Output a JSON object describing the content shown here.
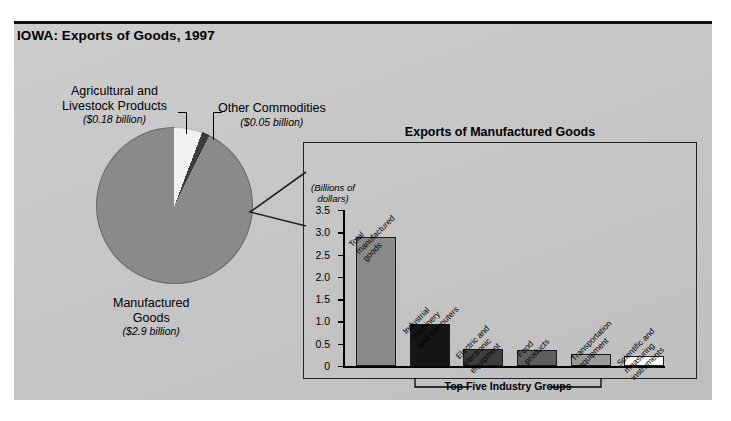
{
  "figure": {
    "title": "IOWA: Exports of Goods, 1997",
    "background_color": "#c9c9c9"
  },
  "pie": {
    "slices": [
      {
        "label": "Agricultural and Livestock Products",
        "label_line1": "Agricultural and",
        "label_line2": "Livestock Products",
        "value_text": "($0.18 billion)",
        "value": 0.18,
        "color": "#f2f2f2"
      },
      {
        "label": "Other Commodities",
        "label_line1": "Other Commodities",
        "label_line2": "",
        "value_text": "($0.05 billion)",
        "value": 0.05,
        "color": "#3b3b3b"
      },
      {
        "label": "Manufactured Goods",
        "label_line1": "Manufactured",
        "label_line2": "Goods",
        "value_text": "($2.9 billion)",
        "value": 2.9,
        "color": "#8a8a8a"
      }
    ]
  },
  "callout": {
    "title": "Exports of Manufactured Goods",
    "axis_units_line1": "(Billions of",
    "axis_units_line2": "dollars)",
    "bracket_label": "Top Five Industry Groups"
  },
  "chart_data": {
    "type": "bar",
    "title": "Exports of Manufactured Goods",
    "xlabel": "Top Five Industry Groups",
    "ylabel": "(Billions of dollars)",
    "ylim": [
      0,
      3.5
    ],
    "yticks": [
      "0",
      "0.5",
      "1.0",
      "1.5",
      "2.0",
      "2.5",
      "3.0",
      "3.5"
    ],
    "ytick_values": [
      0,
      0.5,
      1.0,
      1.5,
      2.0,
      2.5,
      3.0,
      3.5
    ],
    "grid": false,
    "legend": "none",
    "categories": [
      "Total manufactured goods",
      "Industrial machinery and computers",
      "Electric and electronic equipment",
      "Food products",
      "Transportation equipment",
      "Scientific and measuring instruments"
    ],
    "values": [
      2.9,
      0.95,
      0.39,
      0.36,
      0.26,
      0.23
    ],
    "bar_colors": [
      "#8a8a8a",
      "#161616",
      "#3d3d3d",
      "#5e5e5e",
      "#9a9a9a",
      "#ffffff"
    ],
    "bar_labels": [
      {
        "lines": [
          "Total",
          "manufactured",
          "goods"
        ]
      },
      {
        "lines": [
          "Industrial",
          "machinery",
          "and computers"
        ]
      },
      {
        "lines": [
          "Electric and",
          "electronic",
          "equipment"
        ]
      },
      {
        "lines": [
          "Food",
          "products"
        ]
      },
      {
        "lines": [
          "Transportation",
          "equipment"
        ]
      },
      {
        "lines": [
          "Scientific and",
          "measuring",
          "instruments"
        ]
      }
    ]
  },
  "secondary_chart": {
    "type": "pie",
    "title": "IOWA: Exports of Goods, 1997",
    "labels": [
      "Manufactured Goods",
      "Agricultural and Livestock Products",
      "Other Commodities"
    ],
    "values": [
      2.9,
      0.18,
      0.05
    ],
    "unit": "billions of dollars"
  }
}
